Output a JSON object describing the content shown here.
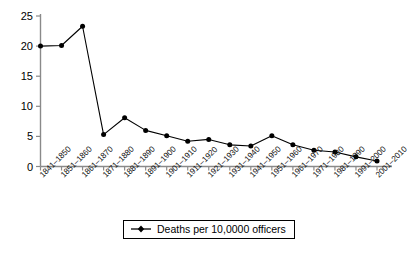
{
  "chart_data": {
    "type": "line",
    "title": "",
    "subtitle": "",
    "xlabel": "",
    "ylabel": "",
    "categories": [
      "1841–1850",
      "1851–1860",
      "1861–1870",
      "1871–1880",
      "1881–1890",
      "1891–1900",
      "1901–1910",
      "1911–1920",
      "1921–1930",
      "1931–1940",
      "1941–1950",
      "1951–1960",
      "1961–1970",
      "1971–1980",
      "1981–1990",
      "1991–2000",
      "2001–2010"
    ],
    "series": [
      {
        "name": "Deaths per 10,0000 officers",
        "values": [
          20.0,
          20.1,
          23.3,
          5.3,
          8.1,
          6.0,
          5.1,
          4.2,
          4.5,
          3.6,
          3.4,
          5.1,
          3.6,
          2.7,
          2.4,
          1.6,
          0.9
        ]
      }
    ],
    "ylim": [
      0,
      25
    ],
    "yticks": [
      0,
      5,
      10,
      15,
      20,
      25
    ],
    "ytick_labels": [
      "0",
      "5",
      "10",
      "15",
      "20",
      "25"
    ],
    "grid": false,
    "legend_position": "bottom-center",
    "marker": "circle",
    "line_color": "#000000",
    "marker_color": "#000000",
    "axis_color": "#808080"
  },
  "legend": {
    "entries": [
      {
        "label": "Deaths per 10,0000 officers",
        "color": "#000000",
        "marker": "diamond-line"
      }
    ]
  }
}
